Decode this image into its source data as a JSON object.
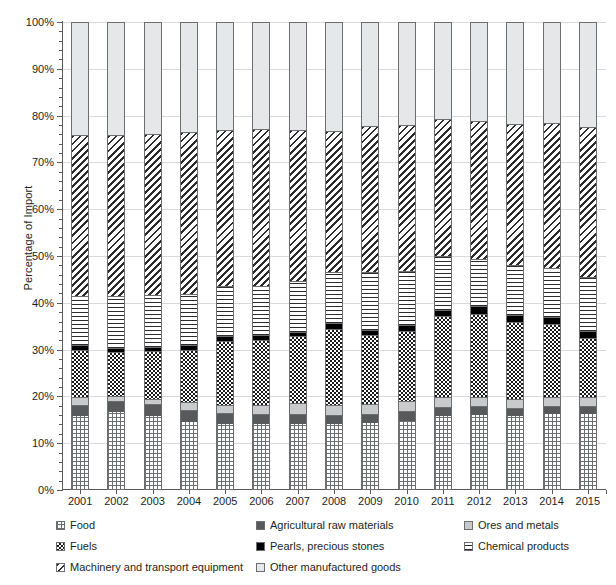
{
  "chart_data": {
    "type": "bar",
    "subtype": "stacked-percentage",
    "title": "",
    "xlabel": "",
    "ylabel": "Percentage of Import",
    "ylim": [
      0,
      100
    ],
    "ytick_labels": [
      "0%",
      "10%",
      "20%",
      "30%",
      "40%",
      "50%",
      "60%",
      "70%",
      "80%",
      "90%",
      "100%"
    ],
    "ytick_values": [
      0,
      10,
      20,
      30,
      40,
      50,
      60,
      70,
      80,
      90,
      100
    ],
    "grid": true,
    "minor_ticks": true,
    "legend_position": "bottom",
    "categories": [
      "2001",
      "2002",
      "2003",
      "2004",
      "2005",
      "2006",
      "2007",
      "2008",
      "2009",
      "2010",
      "2011",
      "2012",
      "2013",
      "2014",
      "2015"
    ],
    "series": [
      {
        "name": "Food",
        "pattern": "grid",
        "values": [
          15.8,
          16.6,
          15.8,
          14.6,
          14.0,
          14.1,
          14.2,
          14.0,
          14.4,
          14.8,
          15.9,
          16.1,
          15.8,
          16.2,
          16.3
        ]
      },
      {
        "name": "Agricultural raw materials",
        "pattern": "dark-gray-solid",
        "values": [
          2.4,
          2.5,
          2.6,
          2.6,
          2.5,
          2.2,
          2.1,
          2.0,
          1.9,
          2.0,
          1.9,
          1.8,
          1.7,
          1.7,
          1.6
        ]
      },
      {
        "name": "Ores and metals",
        "pattern": "light-gray-solid",
        "values": [
          1.7,
          1.0,
          1.1,
          1.6,
          1.6,
          1.9,
          2.2,
          2.2,
          2.0,
          2.2,
          2.1,
          2.0,
          2.0,
          2.0,
          1.9
        ]
      },
      {
        "name": "Fuels",
        "pattern": "checkerboard",
        "values": [
          10.1,
          9.4,
          10.2,
          11.1,
          13.8,
          13.9,
          14.3,
          16.3,
          14.8,
          15.0,
          17.3,
          17.8,
          16.4,
          15.6,
          12.7
        ]
      },
      {
        "name": "Pearls, precious stones",
        "pattern": "black-solid",
        "values": [
          0.9,
          0.9,
          0.9,
          1.0,
          1.0,
          1.0,
          1.0,
          1.1,
          1.1,
          1.2,
          1.3,
          1.6,
          1.5,
          1.4,
          1.4
        ]
      },
      {
        "name": "Chemical products",
        "pattern": "horizontal-lines",
        "values": [
          10.6,
          11.1,
          11.0,
          11.0,
          10.6,
          10.5,
          10.8,
          11.0,
          12.4,
          11.7,
          11.4,
          10.1,
          10.7,
          10.6,
          11.6
        ]
      },
      {
        "name": "Machinery and transport equipment",
        "pattern": "diagonal-hatch",
        "values": [
          34.4,
          34.3,
          34.5,
          34.5,
          33.4,
          33.5,
          32.3,
          30.1,
          31.2,
          31.0,
          29.3,
          29.4,
          30.1,
          30.9,
          32.0
        ]
      },
      {
        "name": "Other manufactured goods",
        "pattern": "very-light-gray-solid",
        "values": [
          24.1,
          24.2,
          23.9,
          23.6,
          23.1,
          22.9,
          23.1,
          23.3,
          22.2,
          22.1,
          20.8,
          21.2,
          21.8,
          21.6,
          22.5
        ]
      }
    ]
  },
  "legend": {
    "items": [
      {
        "label": "Food",
        "pattern": "food",
        "column": 0,
        "row": 0
      },
      {
        "label": "Agricultural raw materials",
        "pattern": "agri",
        "column": 1,
        "row": 0
      },
      {
        "label": "Ores and metals",
        "pattern": "ores",
        "column": 2,
        "row": 0
      },
      {
        "label": "Fuels",
        "pattern": "fuels",
        "column": 0,
        "row": 1
      },
      {
        "label": "Pearls, precious stones",
        "pattern": "pearls",
        "column": 1,
        "row": 1
      },
      {
        "label": "Chemical products",
        "pattern": "chem",
        "column": 2,
        "row": 1
      },
      {
        "label": "Machinery and transport equipment",
        "pattern": "mach",
        "column": 0,
        "row": 2
      },
      {
        "label": "Other manufactured goods",
        "pattern": "other",
        "column": 1,
        "row": 2
      }
    ]
  },
  "colors": {
    "axis": "#58595b",
    "gridline": "#d9d9d9",
    "bar_outline": "#6d6e71",
    "agricultural_raw_materials": "#58595b",
    "ores_and_metals": "#c9cacc",
    "pearls_precious_stones": "#000000",
    "other_manufactured_goods": "#e6e7e8",
    "text": "#231f20"
  }
}
